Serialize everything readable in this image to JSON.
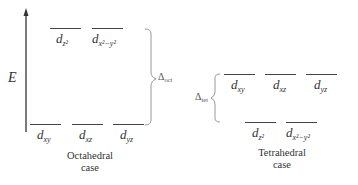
{
  "axis": {
    "label": "E"
  },
  "octahedral": {
    "caption_line1": "Octahedral",
    "caption_line2": "case",
    "upper_levels": [
      {
        "symbol": "d",
        "subscript": "z²"
      },
      {
        "symbol": "d",
        "subscript": "x²−y²"
      }
    ],
    "lower_levels": [
      {
        "symbol": "d",
        "subscript": "xy"
      },
      {
        "symbol": "d",
        "subscript": "xz"
      },
      {
        "symbol": "d",
        "subscript": "yz"
      }
    ],
    "splitting": {
      "symbol": "Δ",
      "subscript": "oct"
    }
  },
  "tetrahedral": {
    "caption_line1": "Tetrahedral",
    "caption_line2": "case",
    "upper_levels": [
      {
        "symbol": "d",
        "subscript": "xy"
      },
      {
        "symbol": "d",
        "subscript": "xz"
      },
      {
        "symbol": "d",
        "subscript": "yz"
      }
    ],
    "lower_levels": [
      {
        "symbol": "d",
        "subscript": "z²"
      },
      {
        "symbol": "d",
        "subscript": "x²−y²"
      }
    ],
    "splitting": {
      "symbol": "Δ",
      "subscript": "tet"
    }
  }
}
